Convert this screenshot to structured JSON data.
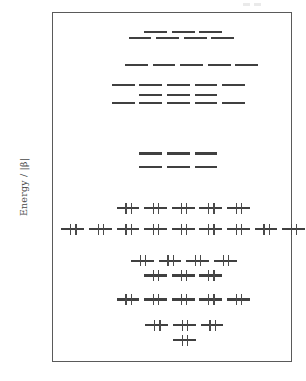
{
  "figure": {
    "title": "",
    "y_axis_label": "Energy / |β|"
  },
  "chart_data": {
    "type": "scatter",
    "title": "",
    "subtitle": "",
    "xlabel": "",
    "ylabel": "Energy / |β|",
    "xlim": [
      0,
      1
    ],
    "ylim": [
      -3.45,
      2.95
    ],
    "grid": false,
    "legend": null,
    "y_ticks": [
      2,
      1,
      0,
      -1,
      -2,
      -3
    ],
    "y_tick_labels": [
      "2",
      "1",
      "0",
      "−1",
      "−2",
      "−3"
    ],
    "levels": [
      {
        "energy": 2.6,
        "degeneracy": 3,
        "occupied": false,
        "electrons": 0,
        "x_start": 0.38,
        "x_step": 0.115,
        "width": 0.095
      },
      {
        "energy": 2.5,
        "degeneracy": 4,
        "occupied": false,
        "electrons": 0,
        "x_start": 0.315,
        "x_step": 0.115,
        "width": 0.095
      },
      {
        "energy": 2.0,
        "degeneracy": 5,
        "occupied": false,
        "electrons": 0,
        "x_start": 0.3,
        "x_step": 0.115,
        "width": 0.095
      },
      {
        "energy": 1.63,
        "degeneracy": 5,
        "occupied": false,
        "electrons": 0,
        "x_start": 0.245,
        "x_step": 0.115,
        "width": 0.095
      },
      {
        "energy": 1.45,
        "degeneracy": 3,
        "occupied": false,
        "electrons": 0,
        "x_start": 0.36,
        "x_step": 0.115,
        "width": 0.095
      },
      {
        "energy": 1.3,
        "degeneracy": 5,
        "occupied": false,
        "electrons": 0,
        "x_start": 0.245,
        "x_step": 0.115,
        "width": 0.095
      },
      {
        "energy": 0.38,
        "degeneracy": 3,
        "occupied": false,
        "electrons": 0,
        "x_start": 0.36,
        "x_step": 0.115,
        "width": 0.095
      },
      {
        "energy": 0.13,
        "degeneracy": 3,
        "occupied": false,
        "electrons": 0,
        "x_start": 0.36,
        "x_step": 0.115,
        "width": 0.095
      },
      {
        "energy": -0.62,
        "degeneracy": 5,
        "occupied": true,
        "electrons": 2,
        "x_start": 0.265,
        "x_step": 0.115,
        "width": 0.095
      },
      {
        "energy": -1.0,
        "degeneracy": 9,
        "occupied": true,
        "electrons": 2,
        "x_start": 0.035,
        "x_step": 0.115,
        "width": 0.095
      },
      {
        "energy": -1.58,
        "degeneracy": 4,
        "occupied": true,
        "electrons": 2,
        "x_start": 0.325,
        "x_step": 0.115,
        "width": 0.095
      },
      {
        "energy": -1.85,
        "degeneracy": 3,
        "occupied": true,
        "electrons": 2,
        "x_start": 0.38,
        "x_step": 0.115,
        "width": 0.095
      },
      {
        "energy": -2.29,
        "degeneracy": 5,
        "occupied": true,
        "electrons": 2,
        "x_start": 0.265,
        "x_step": 0.115,
        "width": 0.095
      },
      {
        "energy": -2.76,
        "degeneracy": 3,
        "occupied": true,
        "electrons": 2,
        "x_start": 0.385,
        "x_step": 0.115,
        "width": 0.095
      },
      {
        "energy": -3.03,
        "degeneracy": 1,
        "occupied": true,
        "electrons": 2,
        "x_start": 0.5,
        "x_step": 0.115,
        "width": 0.095
      }
    ],
    "total_orbitals": 56,
    "total_occupied_orbitals": 30,
    "total_electrons": 60,
    "homo_energy": -0.62,
    "lumo_energy": 0.13,
    "homo_lumo_gap": 0.75
  },
  "colors": {
    "level_line": "#404040",
    "electron_arrow": "#4a4a4a",
    "frame": "#5a5a5a",
    "text": "#4a4a4a",
    "background": "#ffffff"
  }
}
